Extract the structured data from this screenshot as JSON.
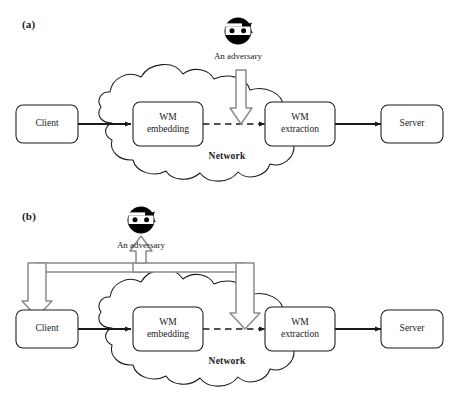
{
  "figure": {
    "type": "block-diagram",
    "background": "#ffffff",
    "stroke_color": "#1a1a1a",
    "gray_arrow_color": "#8c8c8c",
    "panels": [
      {
        "id": "a",
        "label": "(a)",
        "nodes": {
          "client": "Client",
          "wm_embedding_line1": "WM",
          "wm_embedding_line2": "embedding",
          "wm_extraction_line1": "WM",
          "wm_extraction_line2": "extraction",
          "server": "Server",
          "network": "Network",
          "adversary": "An adversary"
        },
        "adversary_icon": "masked-bandit-icon",
        "attack_targets": [
          "channel-between-embedding-and-extraction"
        ]
      },
      {
        "id": "b",
        "label": "(b)",
        "nodes": {
          "client": "Client",
          "wm_embedding_line1": "WM",
          "wm_embedding_line2": "embedding",
          "wm_extraction_line1": "WM",
          "wm_extraction_line2": "extraction",
          "server": "Server",
          "network": "Network",
          "adversary": "An adversary"
        },
        "adversary_icon": "masked-bandit-icon",
        "attack_targets": [
          "client",
          "channel-between-embedding-and-extraction"
        ]
      }
    ]
  }
}
